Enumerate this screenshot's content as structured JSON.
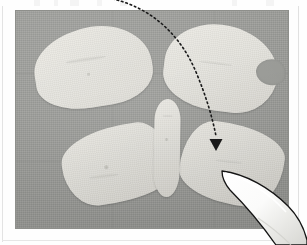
{
  "document": {
    "kind": "scanned-page-with-photograph",
    "page_background": "#fefefe",
    "top_text_remnants": "",
    "frame_line_color": "#e3e3e3"
  },
  "photograph": {
    "name": "butterfly-cutout-photo",
    "caption": "",
    "background_color": "#9a9b97",
    "background_material": "woven gray fabric",
    "bounds": {
      "left": 16,
      "top": 11,
      "width": 272,
      "height": 217
    }
  },
  "subject": {
    "name": "butterfly-shaped-cutout",
    "piece_color": "#e4e3dd",
    "pieces": [
      {
        "id": "wing-upper-left",
        "label": "upper left wing",
        "shape": "rounded blob"
      },
      {
        "id": "wing-upper-right",
        "label": "upper right wing",
        "shape": "rounded blob with notch"
      },
      {
        "id": "wing-lower-left",
        "label": "lower left wing",
        "shape": "lens / leaf"
      },
      {
        "id": "wing-lower-right",
        "label": "lower right wing",
        "shape": "lens / leaf"
      },
      {
        "id": "body",
        "label": "central body",
        "shape": "narrow vertical ellipse"
      }
    ]
  },
  "annotation": {
    "name": "dotted-arrow-annotation",
    "style": "dotted curve with solid triangular arrowhead",
    "color": "#1a1a1a",
    "dot_pattern": "1.6 3",
    "stroke_width": 1.6,
    "path": "M 108 -2 C 150 6 180 34 196 72 C 206 96 212 116 216 136",
    "arrowhead": {
      "points": "209.5,139 222.5,139 216,151",
      "tip_x": 216,
      "tip_y": 151
    },
    "target": "wing-lower-right",
    "label": ""
  },
  "pointer": {
    "name": "stylus-pointer",
    "type": "white pen / stylus tip",
    "body_color": "#fdfdfd",
    "outline_color": "#141414",
    "enters_from": "bottom-right",
    "tip_x": 222,
    "tip_y": 170
  },
  "colors": {
    "fabric_gray": "#9a9b97",
    "cutout_cream": "#e4e3dd",
    "annotation_black": "#1a1a1a",
    "page_white": "#fefefe"
  }
}
